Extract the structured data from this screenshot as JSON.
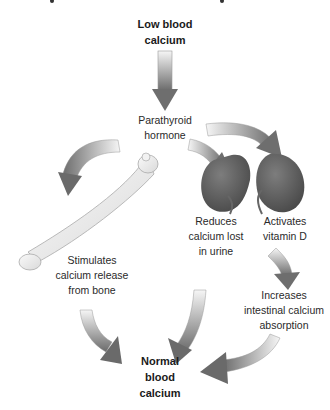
{
  "diagram": {
    "title_clipped": true,
    "nodes": {
      "low": {
        "lines": [
          "Low blood",
          "calcium"
        ]
      },
      "pth": {
        "lines": [
          "Parathyroid",
          "hormone"
        ]
      },
      "bone": {
        "lines": [
          "Stimulates",
          "calcium release",
          "from bone"
        ]
      },
      "urine": {
        "lines": [
          "Reduces",
          "calcium lost",
          "in urine"
        ]
      },
      "vitd": {
        "lines": [
          "Activates",
          "vitamin D"
        ]
      },
      "intestine": {
        "lines": [
          "Increases",
          "intestinal calcium",
          "absorption"
        ]
      },
      "normal": {
        "lines": [
          "Normal",
          "blood",
          "calcium"
        ]
      }
    },
    "icons": {
      "bone": "femur-bone-icon",
      "kidney_left": "kidney-icon",
      "kidney_right": "kidney-icon"
    },
    "colors": {
      "arrow_dark": "#6e6e6e",
      "arrow_light": "#f4f4f4",
      "kidney": "#5f5f5f",
      "bone": "#ececec",
      "text": "#2a2a2a"
    }
  }
}
